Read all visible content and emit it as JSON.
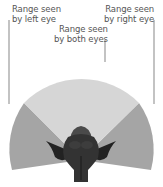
{
  "labels": {
    "left_eye": {
      "line1": "Range seen",
      "line2": "by left eye"
    },
    "right_eye": {
      "line1": "Range seen",
      "line2": "by right eye"
    },
    "both_eyes": {
      "line1": "Range seen",
      "line2": "by both eyes"
    }
  },
  "colors": {
    "monocular": "#a5a5a5",
    "binocular": "#d6d6d6",
    "leader_line": "#555555",
    "animal_dark": "#2b2b2b",
    "animal_mid": "#4a4a4a",
    "text": "#555555"
  }
}
